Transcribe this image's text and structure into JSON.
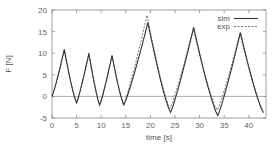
{
  "chart_data": {
    "type": "line",
    "title": "",
    "xlabel": "time [s]",
    "ylabel": "F [N]",
    "xlim": [
      0,
      43.5
    ],
    "ylim": [
      -5,
      20
    ],
    "xticks": [
      0,
      5,
      10,
      15,
      20,
      25,
      30,
      35,
      40
    ],
    "yticks": [
      -5,
      0,
      5,
      10,
      15,
      20
    ],
    "grid": false,
    "zero_line": true,
    "legend_position": "upper right",
    "series": [
      {
        "name": "sim",
        "style": "solid",
        "x": [
          0,
          2.5,
          5.0,
          7.5,
          9.7,
          12.2,
          14.6,
          19.5,
          24.1,
          28.8,
          33.7,
          38.3,
          43.0
        ],
        "y": [
          0,
          10.9,
          -1.5,
          10.0,
          -2.0,
          9.5,
          -2.0,
          17.1,
          -3.7,
          16.0,
          -4.4,
          14.8,
          -3.8
        ]
      },
      {
        "name": "exp",
        "style": "dashed",
        "x": [
          0,
          2.5,
          5.0,
          7.5,
          9.7,
          12.2,
          14.6,
          19.3,
          24.0,
          28.7,
          33.6,
          38.2,
          43.0
        ],
        "y": [
          0,
          10.6,
          -1.3,
          9.7,
          -1.8,
          9.3,
          -1.8,
          18.8,
          -2.8,
          15.8,
          -3.2,
          14.6,
          -3.5
        ]
      }
    ]
  },
  "labels": {
    "xlabel": "time [s]",
    "ylabel": "F [N]",
    "legend_sim": "sim",
    "legend_exp": "exp",
    "xtick_0": "0",
    "xtick_1": "5",
    "xtick_2": "10",
    "xtick_3": "15",
    "xtick_4": "20",
    "xtick_5": "25",
    "xtick_6": "30",
    "xtick_7": "35",
    "xtick_8": "40",
    "ytick_0": "-5",
    "ytick_1": "0",
    "ytick_2": "5",
    "ytick_3": "10",
    "ytick_4": "15",
    "ytick_5": "20"
  },
  "colors": {
    "sim": "#333333",
    "exp": "#666666",
    "frame": "#888888",
    "zero_line": "#999999"
  }
}
